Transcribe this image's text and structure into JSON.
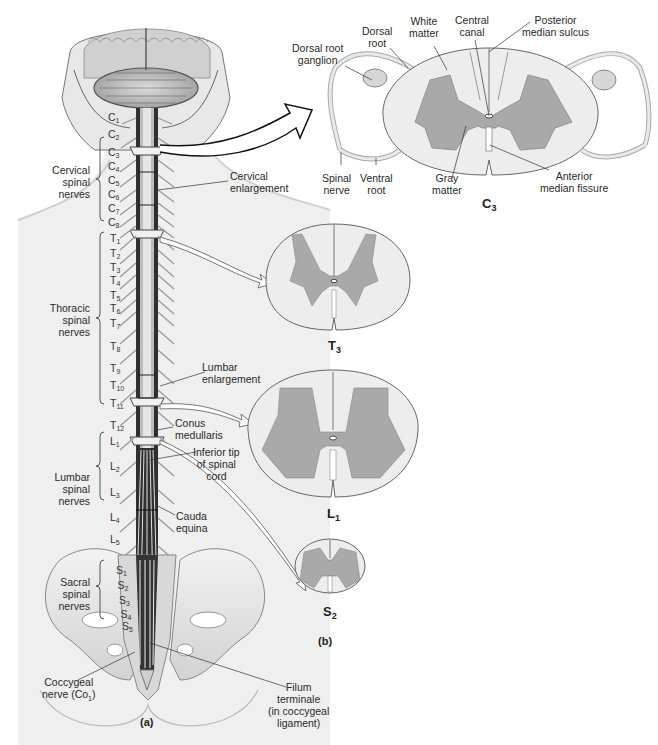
{
  "figure": {
    "panel_a": "(a)",
    "panel_b": "(b)"
  },
  "colors": {
    "white_matter": "#ededed",
    "gray_matter": "#a9a9a9",
    "outline": "#555555",
    "body_skin": "#eeeeee",
    "bone": "#e4e4e4",
    "cord_dark": "#3a3a3a"
  },
  "nerve_groups": [
    {
      "id": "cervical",
      "label": "Cervical\nspinal\nnerves",
      "l1": "Cervical",
      "l2": "spinal",
      "l3": "nerves",
      "segments": [
        {
          "s": "C",
          "n": "1"
        },
        {
          "s": "C",
          "n": "2"
        },
        {
          "s": "C",
          "n": "3"
        },
        {
          "s": "C",
          "n": "4"
        },
        {
          "s": "C",
          "n": "5"
        },
        {
          "s": "C",
          "n": "6"
        },
        {
          "s": "C",
          "n": "7"
        },
        {
          "s": "C",
          "n": "8"
        }
      ]
    },
    {
      "id": "thoracic",
      "l1": "Thoracic",
      "l2": "spinal",
      "l3": "nerves",
      "segments": [
        {
          "s": "T",
          "n": "1"
        },
        {
          "s": "T",
          "n": "2"
        },
        {
          "s": "T",
          "n": "3"
        },
        {
          "s": "T",
          "n": "4"
        },
        {
          "s": "T",
          "n": "5"
        },
        {
          "s": "T",
          "n": "6"
        },
        {
          "s": "T",
          "n": "7"
        },
        {
          "s": "T",
          "n": "8"
        },
        {
          "s": "T",
          "n": "9"
        },
        {
          "s": "T",
          "n": "10"
        },
        {
          "s": "T",
          "n": "11"
        },
        {
          "s": "T",
          "n": "12"
        }
      ]
    },
    {
      "id": "lumbar",
      "l1": "Lumbar",
      "l2": "spinal",
      "l3": "nerves",
      "segments": [
        {
          "s": "L",
          "n": "1"
        },
        {
          "s": "L",
          "n": "2"
        },
        {
          "s": "L",
          "n": "3"
        },
        {
          "s": "L",
          "n": "4"
        },
        {
          "s": "L",
          "n": "5"
        }
      ]
    },
    {
      "id": "sacral",
      "l1": "Sacral",
      "l2": "spinal",
      "l3": "nerves",
      "segments": [
        {
          "s": "S",
          "n": "1"
        },
        {
          "s": "S",
          "n": "2"
        },
        {
          "s": "S",
          "n": "3"
        },
        {
          "s": "S",
          "n": "4"
        },
        {
          "s": "S",
          "n": "5"
        }
      ]
    }
  ],
  "callouts_a": {
    "cervical_enlargement": [
      "Cervical",
      "enlargement"
    ],
    "lumbar_enlargement": [
      "Lumbar",
      "enlargement"
    ],
    "conus_medullaris": [
      "Conus",
      "medullaris"
    ],
    "inferior_tip": [
      "Inferior tip",
      "of spinal",
      "cord"
    ],
    "cauda_equina": [
      "Cauda",
      "equina"
    ],
    "coccygeal_nerve": [
      "Coccygeal",
      "nerve (Co",
      "1",
      ")"
    ],
    "filum_terminale": [
      "Filum",
      "terminale",
      "(in coccygeal",
      "ligament)"
    ]
  },
  "callouts_c3": {
    "dorsal_root_ganglion": [
      "Dorsal root",
      "ganglion"
    ],
    "dorsal_root": [
      "Dorsal",
      "root"
    ],
    "white_matter": [
      "White",
      "matter"
    ],
    "central_canal": [
      "Central",
      "canal"
    ],
    "posterior_median_sulcus": [
      "Posterior",
      "median sulcus"
    ],
    "spinal_nerve": [
      "Spinal",
      "nerve"
    ],
    "ventral_root": [
      "Ventral",
      "root"
    ],
    "gray_matter": [
      "Gray",
      "matter"
    ],
    "anterior_median_fissure": [
      "Anterior",
      "median fissure"
    ]
  },
  "sections": [
    {
      "id": "C3",
      "letter": "C",
      "num": "3"
    },
    {
      "id": "T3",
      "letter": "T",
      "num": "3"
    },
    {
      "id": "L1",
      "letter": "L",
      "num": "1"
    },
    {
      "id": "S2",
      "letter": "S",
      "num": "2"
    }
  ]
}
